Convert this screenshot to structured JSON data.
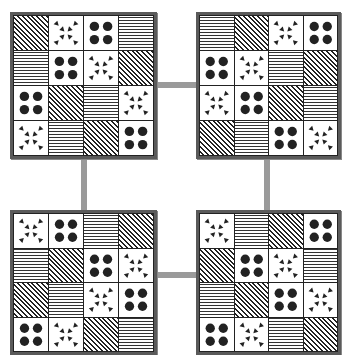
{
  "diagram": {
    "pattern_types": {
      "diag": "diagonal-hatch",
      "horiz": "horizontal-lines",
      "dots": "four-dots",
      "arrows": "inward-arrows"
    },
    "colors": {
      "frame": "#5a5a5a",
      "connector": "#9a9a9a",
      "ink": "#222222",
      "background": "#ffffff"
    },
    "grids": [
      {
        "id": "top-left",
        "cells": [
          [
            "diag",
            "arrows",
            "dots",
            "horiz"
          ],
          [
            "horiz",
            "dots",
            "arrows",
            "diag"
          ],
          [
            "dots",
            "diag",
            "horiz",
            "arrows"
          ],
          [
            "arrows",
            "horiz",
            "diag",
            "dots"
          ]
        ]
      },
      {
        "id": "top-right",
        "cells": [
          [
            "horiz",
            "diag",
            "arrows",
            "dots"
          ],
          [
            "dots",
            "arrows",
            "horiz",
            "diag"
          ],
          [
            "arrows",
            "dots",
            "diag",
            "horiz"
          ],
          [
            "diag",
            "horiz",
            "dots",
            "arrows"
          ]
        ]
      },
      {
        "id": "bottom-left",
        "cells": [
          [
            "arrows",
            "dots",
            "horiz",
            "diag"
          ],
          [
            "horiz",
            "diag",
            "dots",
            "arrows"
          ],
          [
            "diag",
            "horiz",
            "arrows",
            "dots"
          ],
          [
            "dots",
            "arrows",
            "diag",
            "horiz"
          ]
        ]
      },
      {
        "id": "bottom-right",
        "cells": [
          [
            "arrows",
            "horiz",
            "diag",
            "dots"
          ],
          [
            "diag",
            "dots",
            "arrows",
            "horiz"
          ],
          [
            "horiz",
            "diag",
            "dots",
            "arrows"
          ],
          [
            "dots",
            "arrows",
            "horiz",
            "diag"
          ]
        ]
      }
    ],
    "connectors": [
      "top-horizontal",
      "left-vertical",
      "right-vertical",
      "bottom-horizontal"
    ]
  }
}
